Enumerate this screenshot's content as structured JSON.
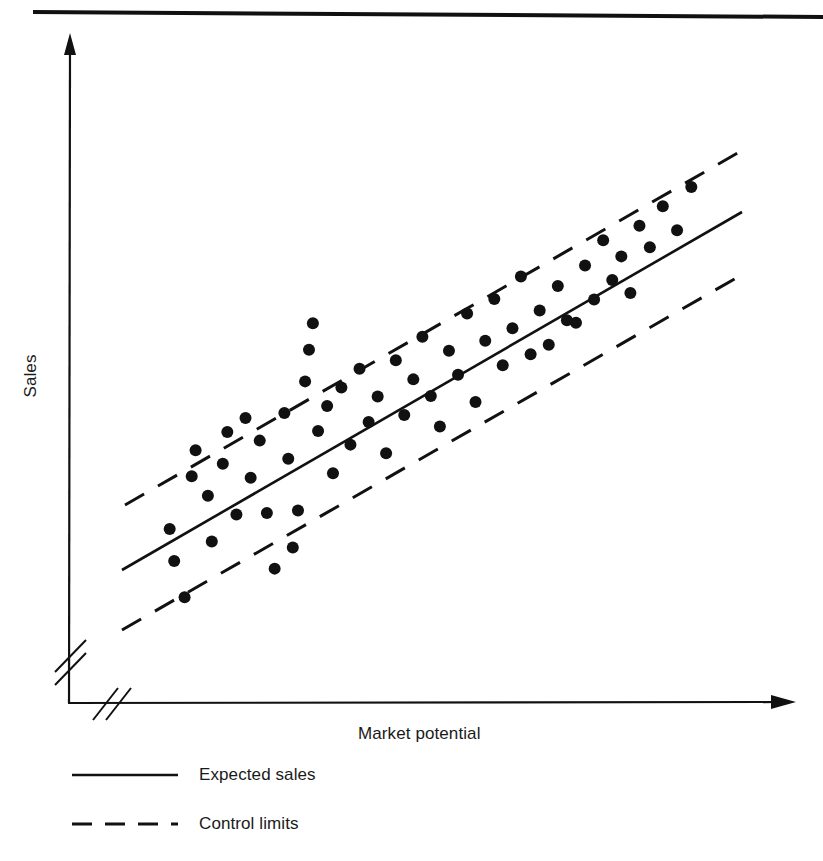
{
  "figure": {
    "background_color": "#ffffff",
    "ink_color": "#111111",
    "top_rule": {
      "present": true,
      "y": 12,
      "x1": 33,
      "x2": 823,
      "y2": 17
    }
  },
  "axes": {
    "x_label": "Market potential",
    "y_label": "Sales",
    "x_axis": {
      "origin_x": 68,
      "origin_y": 703,
      "end_x": 795,
      "end_y": 702,
      "arrow": true,
      "break_mark": true
    },
    "y_axis": {
      "origin_x": 68,
      "origin_y": 703,
      "end_x": 70,
      "end_y": 35,
      "arrow": true,
      "break_mark": true
    }
  },
  "legend": {
    "position": "below-axis-left",
    "items": [
      {
        "label": "Expected sales",
        "style": "solid",
        "color": "#111111"
      },
      {
        "label": "Control limits",
        "style": "dashed",
        "color": "#111111"
      }
    ]
  },
  "chart_data": {
    "type": "scatter",
    "title": "",
    "subtitle": "",
    "xlabel": "Market potential",
    "ylabel": "Sales",
    "xlim": [
      0,
      100
    ],
    "ylim": [
      0,
      100
    ],
    "grid": false,
    "axis_ticks": false,
    "axis_tick_labels": false,
    "legend_position": "below",
    "annotations": [],
    "series": [
      {
        "name": "Territories",
        "type": "scatter",
        "marker": "filled-circle",
        "color": "#111111",
        "marker_radius_px": 6,
        "points": [
          {
            "x": 8.9,
            "y": 26.5
          },
          {
            "x": 9.6,
            "y": 20.1
          },
          {
            "x": 11.2,
            "y": 12.9
          },
          {
            "x": 12.3,
            "y": 37.0
          },
          {
            "x": 12.9,
            "y": 42.2
          },
          {
            "x": 14.8,
            "y": 33.1
          },
          {
            "x": 15.4,
            "y": 24.0
          },
          {
            "x": 17.1,
            "y": 39.5
          },
          {
            "x": 17.8,
            "y": 45.8
          },
          {
            "x": 19.2,
            "y": 29.4
          },
          {
            "x": 20.6,
            "y": 48.6
          },
          {
            "x": 21.4,
            "y": 36.7
          },
          {
            "x": 22.8,
            "y": 44.1
          },
          {
            "x": 23.9,
            "y": 29.7
          },
          {
            "x": 25.1,
            "y": 18.6
          },
          {
            "x": 26.6,
            "y": 49.6
          },
          {
            "x": 27.2,
            "y": 40.5
          },
          {
            "x": 28.7,
            "y": 30.2
          },
          {
            "x": 29.8,
            "y": 55.9
          },
          {
            "x": 30.4,
            "y": 62.2
          },
          {
            "x": 31.8,
            "y": 46.0
          },
          {
            "x": 33.2,
            "y": 51.0
          },
          {
            "x": 34.1,
            "y": 37.6
          },
          {
            "x": 35.4,
            "y": 54.7
          },
          {
            "x": 36.8,
            "y": 43.3
          },
          {
            "x": 38.2,
            "y": 58.4
          },
          {
            "x": 39.6,
            "y": 47.8
          },
          {
            "x": 41.0,
            "y": 52.9
          },
          {
            "x": 42.3,
            "y": 41.6
          },
          {
            "x": 43.8,
            "y": 60.1
          },
          {
            "x": 45.1,
            "y": 49.2
          },
          {
            "x": 46.5,
            "y": 56.3
          },
          {
            "x": 47.9,
            "y": 64.8
          },
          {
            "x": 49.2,
            "y": 53.0
          },
          {
            "x": 50.6,
            "y": 46.9
          },
          {
            "x": 52.0,
            "y": 62.0
          },
          {
            "x": 53.4,
            "y": 57.2
          },
          {
            "x": 54.8,
            "y": 69.4
          },
          {
            "x": 56.1,
            "y": 51.8
          },
          {
            "x": 57.6,
            "y": 64.0
          },
          {
            "x": 59.0,
            "y": 72.3
          },
          {
            "x": 60.3,
            "y": 59.1
          },
          {
            "x": 61.8,
            "y": 66.5
          },
          {
            "x": 63.1,
            "y": 76.8
          },
          {
            "x": 64.6,
            "y": 61.3
          },
          {
            "x": 66.0,
            "y": 70.0
          },
          {
            "x": 67.4,
            "y": 63.2
          },
          {
            "x": 68.8,
            "y": 74.9
          },
          {
            "x": 70.2,
            "y": 68.1
          },
          {
            "x": 71.6,
            "y": 67.6
          },
          {
            "x": 73.0,
            "y": 79.0
          },
          {
            "x": 74.4,
            "y": 72.2
          },
          {
            "x": 75.8,
            "y": 84.0
          },
          {
            "x": 77.2,
            "y": 76.1
          },
          {
            "x": 78.6,
            "y": 80.8
          },
          {
            "x": 80.0,
            "y": 73.5
          },
          {
            "x": 81.4,
            "y": 86.9
          },
          {
            "x": 83.0,
            "y": 82.6
          },
          {
            "x": 85.0,
            "y": 90.8
          },
          {
            "x": 87.2,
            "y": 86.0
          },
          {
            "x": 89.4,
            "y": 94.6
          },
          {
            "x": 31.0,
            "y": 67.5
          },
          {
            "x": 27.9,
            "y": 22.8
          }
        ]
      },
      {
        "name": "Expected sales",
        "type": "line",
        "style": "solid",
        "color": "#111111",
        "line_px": {
          "x1": 122,
          "y1": 570,
          "x2": 742,
          "y2": 212
        }
      },
      {
        "name": "Control limits upper",
        "type": "line",
        "style": "dashed",
        "color": "#111111",
        "line_px": {
          "x1": 125,
          "y1": 505,
          "x2": 748,
          "y2": 147
        }
      },
      {
        "name": "Control limits lower",
        "type": "line",
        "style": "dashed",
        "color": "#111111",
        "line_px": {
          "x1": 122,
          "y1": 630,
          "x2": 738,
          "y2": 277
        }
      }
    ]
  }
}
